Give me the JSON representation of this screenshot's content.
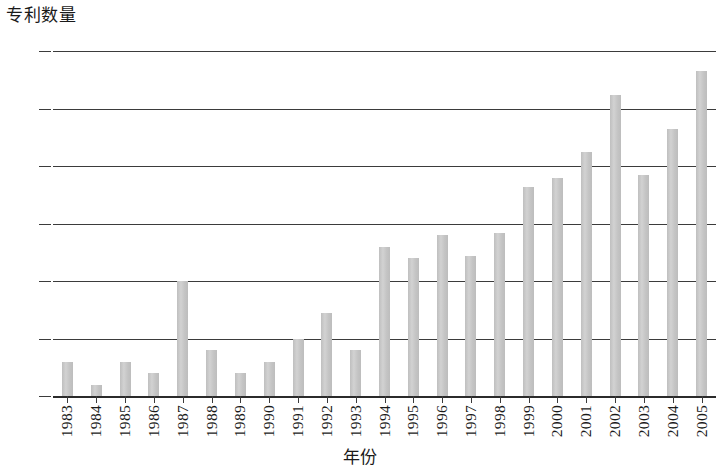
{
  "chart_data": {
    "type": "bar",
    "title": "",
    "subtitle": "",
    "xlabel": "年份",
    "ylabel": "专利数量",
    "categories": [
      "1983",
      "1984",
      "1985",
      "1986",
      "1987",
      "1988",
      "1989",
      "1990",
      "1991",
      "1992",
      "1993",
      "1994",
      "1995",
      "1996",
      "1997",
      "1998",
      "1999",
      "2000",
      "2001",
      "2002",
      "2003",
      "2004",
      "2005"
    ],
    "values": [
      3,
      1,
      3,
      2,
      10,
      4,
      2,
      3,
      5,
      7.2,
      4,
      13,
      12,
      14,
      12.2,
      14.2,
      18.2,
      19,
      21.2,
      26.2,
      19.2,
      23.2,
      28.3
    ],
    "series": [
      {
        "name": "专利数量",
        "values": [
          3,
          1,
          3,
          2,
          10,
          4,
          2,
          3,
          5,
          7.2,
          4,
          13,
          12,
          14,
          12.2,
          14.2,
          18.2,
          19,
          21.2,
          26.2,
          19.2,
          23.2,
          28.3
        ]
      }
    ],
    "ylim": [
      0,
      30
    ],
    "ytick_labels": [
      "0",
      "5",
      "10",
      "15",
      "20",
      "25",
      "30"
    ],
    "ytick_values": [
      0,
      5,
      10,
      15,
      20,
      25,
      30
    ],
    "grid": true,
    "grid_axis": "y",
    "legend": false,
    "legend_position": "none",
    "bar_color": "#c9c9c9",
    "axis_color": "#3b3b3b",
    "background_color": "#ffffff",
    "annotations": []
  }
}
